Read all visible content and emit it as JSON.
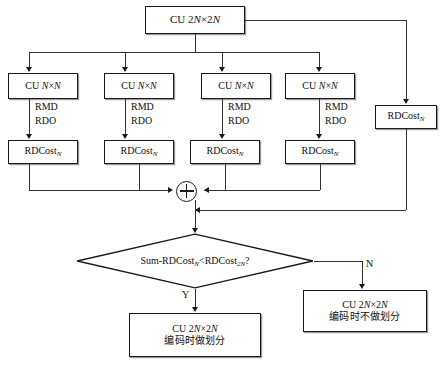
{
  "figure": {
    "caption": ""
  },
  "nodes": {
    "root": {
      "name": "CU 2N×2N",
      "text_prefix": "CU 2",
      "text_italic_1": "N",
      "text_mid": "×2",
      "text_italic_2": "N"
    },
    "sub_cu_label": {
      "prefix": "CU ",
      "italic_1": "N",
      "mid": "×",
      "italic_2": "N"
    },
    "sub_cus": [
      {
        "label": "CU N×N"
      },
      {
        "label": "CU N×N"
      },
      {
        "label": "CU N×N"
      },
      {
        "label": "CU N×N"
      }
    ],
    "rdcost_label": {
      "base": "RDCost",
      "sub": "N"
    },
    "rdcosts": [
      {
        "label": "RDCost",
        "subscript": "N"
      },
      {
        "label": "RDCost",
        "subscript": "N"
      },
      {
        "label": "RDCost",
        "subscript": "N"
      },
      {
        "label": "RDCost",
        "subscript": "N"
      }
    ],
    "rdcost_right": {
      "label": "RDCost",
      "subscript": "N"
    },
    "sum_node": {
      "symbol": "+",
      "name": "summation"
    },
    "decision": {
      "prefix": "Sum-RDCost",
      "sub_left": "N",
      "operator": "<",
      "term_right": "RDCost",
      "sub_right": "2N",
      "suffix": "?"
    },
    "result_yes": {
      "line1_prefix": "CU 2",
      "line1_italic_1": "N",
      "line1_mid": "×2",
      "line1_italic_2": "N",
      "line2": "编码时做划分"
    },
    "result_no": {
      "line1_prefix": "CU 2",
      "line1_italic_1": "N",
      "line1_mid": "×2",
      "line1_italic_2": "N",
      "line2": "编码时不做划分"
    }
  },
  "edge_labels": {
    "rmd": "RMD",
    "rdo": "RDO",
    "yes": "Y",
    "no": "N"
  },
  "colors": {
    "stroke": "#1a1a1a",
    "line": "#333333",
    "text": "#111111",
    "background": "#ffffff",
    "shadow": "#9a9a9a"
  }
}
